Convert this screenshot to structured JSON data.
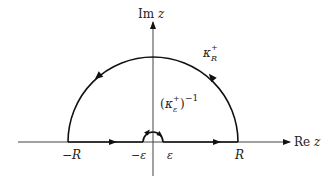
{
  "diagram": {
    "type": "contour-integration-diagram",
    "axes": {
      "vertical_label": {
        "prefix": "Im",
        "var": "z"
      },
      "horizontal_label": {
        "prefix": "Re",
        "var": "z"
      }
    },
    "contours": {
      "large_arc": {
        "label_main": "κ",
        "label_sup": "+",
        "label_sub": "R"
      },
      "small_arc": {
        "open": "(",
        "label_main": "κ",
        "label_sup": "+",
        "label_sub": "ε",
        "close": ")",
        "exponent": "−1"
      }
    },
    "ticks": {
      "neg_R": "−R",
      "neg_eps": "−ε",
      "eps": "ε",
      "R": "R"
    },
    "colors": {
      "stroke": "#111111",
      "axis": "#444444",
      "background": "#ffffff"
    }
  }
}
